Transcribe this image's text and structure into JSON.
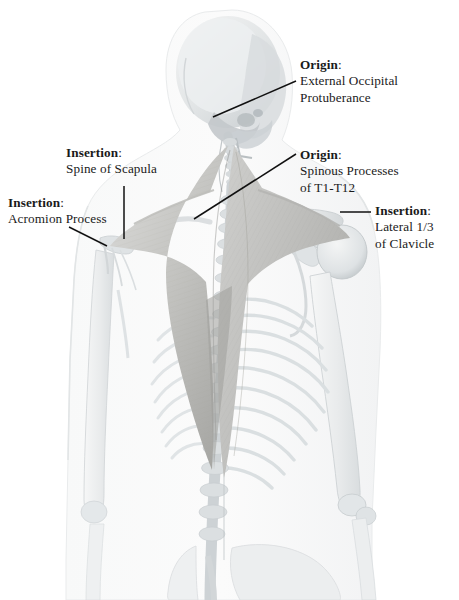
{
  "figure": {
    "view": "posterior",
    "background_color": "#ffffff",
    "bone_color": "#eef0f0",
    "bone_shadow_color": "#c9ced1",
    "muscle_color": "#d2d2d0",
    "muscle_dark_color": "#a9a9a6",
    "soft_tissue_color": "#f4f5f5",
    "leader_color": "#111111"
  },
  "labels": [
    {
      "id": "origin-eop",
      "term": "Origin",
      "colon": ":",
      "line1": "External Occipital",
      "line2": "Protuberance"
    },
    {
      "id": "origin-spinous",
      "term": "Origin",
      "colon": ":",
      "line1": "Spinous Processes",
      "line2": "of T1-T12"
    },
    {
      "id": "insertion-clavicle",
      "term": "Insertion",
      "colon": ":",
      "line1": "Lateral 1/3",
      "line2": "of Clavicle"
    },
    {
      "id": "insertion-scapula",
      "term": "Insertion",
      "colon": ":",
      "line1": "Spine of Scapula",
      "line2": ""
    },
    {
      "id": "insertion-acromion",
      "term": "Insertion",
      "colon": ":",
      "line1": "Acromion Process",
      "line2": ""
    }
  ],
  "structures": [
    "skull",
    "cervical vertebrae",
    "thoracic vertebrae",
    "lumbar vertebrae",
    "sacrum",
    "pelvis",
    "clavicle",
    "scapula",
    "acromion",
    "humerus",
    "radius",
    "ulna",
    "rib cage",
    "trapezius muscle"
  ]
}
